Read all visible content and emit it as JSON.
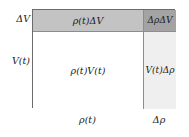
{
  "figure": {
    "cells": [
      {
        "id": "rho-delta-v",
        "label": "ρ(t)ΔV",
        "fill": "#c3c3c3",
        "position": "top-left"
      },
      {
        "id": "delta-rho-delta-v",
        "label": "ΔρΔV",
        "fill": "#a3a3a3",
        "position": "top-right"
      },
      {
        "id": "rho-v",
        "label": "ρ(t)V(t)",
        "fill": "#ffffff",
        "position": "center-left"
      },
      {
        "id": "v-delta-rho",
        "label": "V(t)Δρ",
        "fill": "#efefef",
        "position": "center-right"
      }
    ],
    "axis_labels": {
      "left_top": "ΔV",
      "left_main": "V(t)",
      "bottom_main": "ρ(t)",
      "bottom_right": "Δρ"
    },
    "colors": {
      "border": "#6b6b6b",
      "inner_rule": "#8d8d8d",
      "text": "#1a1a1a",
      "background": "#ffffff"
    }
  }
}
